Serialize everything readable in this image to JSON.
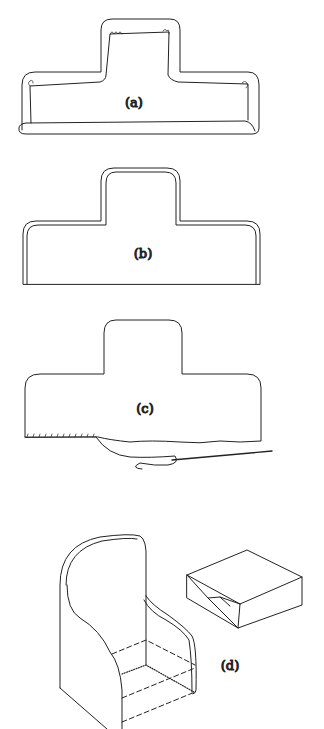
{
  "figures": [
    {
      "id": "a",
      "label": "(a)"
    },
    {
      "id": "b",
      "label": "(b)"
    },
    {
      "id": "c",
      "label": "(c)"
    },
    {
      "id": "d",
      "label": "(d)"
    }
  ],
  "colors": {
    "line": "#222222",
    "background": "#ffffff"
  }
}
